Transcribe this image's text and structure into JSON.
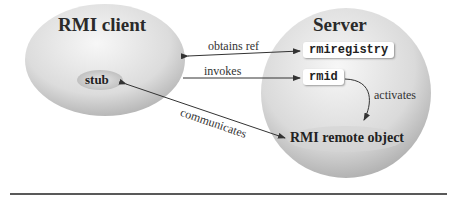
{
  "client": {
    "title": "RMI client",
    "stub": "stub"
  },
  "server": {
    "title": "Server",
    "registry": "rmiregistry",
    "rmid": "rmid",
    "remote_object": "RMI remote object"
  },
  "edges": {
    "obtains_ref": "obtains ref",
    "invokes": "invokes",
    "communicates": "communicates",
    "activates": "activates"
  },
  "colors": {
    "ellipse_light": "#f4f4f4",
    "ellipse_dark": "#b5b5b5",
    "line": "#333333"
  }
}
